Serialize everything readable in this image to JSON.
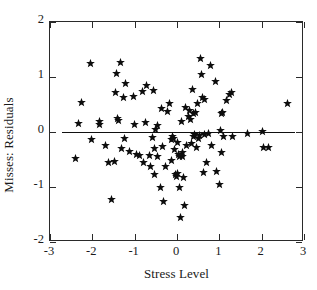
{
  "chart_data": {
    "type": "scatter",
    "title": "",
    "xlabel": "Stress Level",
    "ylabel": "Misses: Residuals",
    "xlim": [
      -3,
      3
    ],
    "ylim": [
      -2,
      2
    ],
    "xticks": [
      -3,
      -2,
      -1,
      0,
      1,
      2,
      3
    ],
    "yticks": [
      -2,
      -1,
      0,
      1,
      2
    ],
    "xticklabels": [
      "-3",
      "-2",
      "-1",
      "0",
      "1",
      "2",
      "3"
    ],
    "yticklabels": [
      "-2",
      "-1",
      "0",
      "1",
      "2"
    ],
    "grid": false,
    "legend": null,
    "marker": "star",
    "marker_color": "#0d0d0d",
    "reference_line": {
      "type": "horizontal",
      "y": 0,
      "x_start": -2.72,
      "x_end": 2.78,
      "color": "#111111"
    },
    "points": [
      [
        -2.4,
        -0.48
      ],
      [
        -2.33,
        0.16
      ],
      [
        -2.25,
        0.54
      ],
      [
        -2.04,
        1.25
      ],
      [
        -2.02,
        -0.14
      ],
      [
        -1.84,
        0.13
      ],
      [
        -1.82,
        0.19
      ],
      [
        -1.7,
        -0.25
      ],
      [
        -1.62,
        -0.55
      ],
      [
        -1.55,
        -1.22
      ],
      [
        -1.48,
        -0.54
      ],
      [
        -1.45,
        0.72
      ],
      [
        -1.42,
        1.06
      ],
      [
        -1.4,
        0.24
      ],
      [
        -1.38,
        0.21
      ],
      [
        -1.34,
        1.27
      ],
      [
        -1.31,
        -0.3
      ],
      [
        -1.27,
        0.62
      ],
      [
        -1.25,
        -0.11
      ],
      [
        -1.22,
        0.89
      ],
      [
        -1.12,
        -0.36
      ],
      [
        -1.02,
        0.64
      ],
      [
        -1.0,
        0.14
      ],
      [
        -0.95,
        -0.41
      ],
      [
        -0.88,
        -0.43
      ],
      [
        -0.82,
        0.73
      ],
      [
        -0.78,
        -0.55
      ],
      [
        -0.74,
        0.18
      ],
      [
        -0.72,
        0.85
      ],
      [
        -0.66,
        -0.42
      ],
      [
        -0.62,
        -0.63
      ],
      [
        -0.58,
        -0.1
      ],
      [
        -0.56,
        0.75
      ],
      [
        -0.54,
        -0.3
      ],
      [
        -0.52,
        -0.78
      ],
      [
        -0.5,
        0.05
      ],
      [
        -0.47,
        0.12
      ],
      [
        -0.45,
        -0.45
      ],
      [
        -0.4,
        -1.0
      ],
      [
        -0.36,
        0.43
      ],
      [
        -0.34,
        -0.26
      ],
      [
        -0.32,
        -1.26
      ],
      [
        -0.28,
        -0.62
      ],
      [
        -0.22,
        0.38
      ],
      [
        -0.18,
        0.52
      ],
      [
        -0.14,
        -0.51
      ],
      [
        -0.12,
        -0.14
      ],
      [
        -0.1,
        -0.09
      ],
      [
        -0.08,
        -0.12
      ],
      [
        -0.06,
        -0.32
      ],
      [
        -0.04,
        -0.78
      ],
      [
        -0.02,
        -0.8
      ],
      [
        0.0,
        -0.76
      ],
      [
        0.02,
        -0.19
      ],
      [
        0.04,
        -0.4
      ],
      [
        0.06,
        -0.44
      ],
      [
        0.07,
        -1.01
      ],
      [
        0.08,
        -1.56
      ],
      [
        0.1,
        0.19
      ],
      [
        0.12,
        -0.37
      ],
      [
        0.14,
        -0.45
      ],
      [
        0.16,
        -0.82
      ],
      [
        0.18,
        -1.34
      ],
      [
        0.2,
        0.45
      ],
      [
        0.22,
        -0.24
      ],
      [
        0.26,
        0.28
      ],
      [
        0.3,
        0.4
      ],
      [
        0.32,
        0.22
      ],
      [
        0.34,
        -0.21
      ],
      [
        0.36,
        0.78
      ],
      [
        0.38,
        0.33
      ],
      [
        0.4,
        -0.09
      ],
      [
        0.42,
        -0.05
      ],
      [
        0.44,
        0.36
      ],
      [
        0.46,
        -0.28
      ],
      [
        0.48,
        0.51
      ],
      [
        0.5,
        -0.12
      ],
      [
        0.52,
        -0.06
      ],
      [
        0.56,
        1.34
      ],
      [
        0.58,
        1.04
      ],
      [
        0.6,
        0.62
      ],
      [
        0.62,
        -0.74
      ],
      [
        0.64,
        -0.05
      ],
      [
        0.66,
        0.59
      ],
      [
        0.7,
        -0.56
      ],
      [
        0.74,
        -0.02
      ],
      [
        0.78,
        1.21
      ],
      [
        0.82,
        -0.25
      ],
      [
        0.9,
        0.91
      ],
      [
        0.94,
        -0.72
      ],
      [
        1.0,
        -0.96
      ],
      [
        1.02,
        0.03
      ],
      [
        1.04,
        -0.38
      ],
      [
        1.06,
        0.34
      ],
      [
        1.08,
        0.36
      ],
      [
        1.1,
        -0.09
      ],
      [
        1.18,
        0.57
      ],
      [
        1.24,
        0.68
      ],
      [
        1.28,
        0.71
      ],
      [
        1.3,
        -0.08
      ],
      [
        1.66,
        -0.02
      ],
      [
        2.02,
        0.01
      ],
      [
        2.05,
        -0.28
      ],
      [
        2.15,
        -0.29
      ],
      [
        2.62,
        0.51
      ]
    ]
  }
}
